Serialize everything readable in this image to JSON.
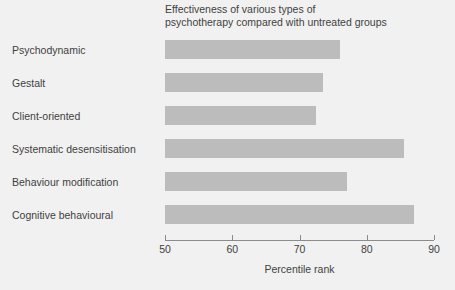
{
  "chart_data": {
    "type": "bar",
    "orientation": "horizontal",
    "title": "Effectiveness of various types of\npsychotherapy compared with untreated groups",
    "xlabel": "Percentile rank",
    "ylabel": "",
    "xlim": [
      50,
      90
    ],
    "xticks": [
      50,
      60,
      70,
      80,
      90
    ],
    "xtick_labels": [
      "50",
      "60",
      "70",
      "80",
      "90"
    ],
    "grid": false,
    "legend": false,
    "bar_color": "#bcbcbc",
    "background_color": "#f1f1f1",
    "axis_color": "#8c8c8c",
    "text_color": "#3f3f3f",
    "categories": [
      "Psychodynamic",
      "Gestalt",
      "Client-oriented",
      "Systematic desensitisation",
      "Behaviour modification",
      "Cognitive behavioural"
    ],
    "values": [
      76,
      73.5,
      72.5,
      85.5,
      77,
      87
    ]
  }
}
